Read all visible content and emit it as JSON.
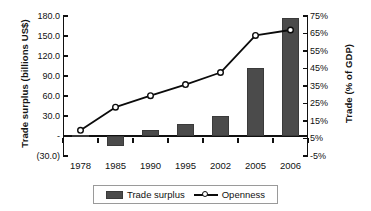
{
  "chart_data": {
    "type": "bar",
    "title": "",
    "subtitle": "",
    "categories": [
      "1978",
      "1985",
      "1990",
      "1995",
      "2002",
      "2005",
      "2006"
    ],
    "series": [
      {
        "name": "Trade surplus",
        "type": "bar",
        "axis": "left",
        "unit": "billions US$",
        "values": [
          1.0,
          -14.9,
          9.0,
          18.0,
          30.4,
          102.0,
          177.5
        ]
      },
      {
        "name": "Openness",
        "type": "line",
        "axis": "right",
        "unit": "% of GDP",
        "values": [
          9.7,
          22.9,
          29.5,
          35.8,
          42.7,
          63.9,
          67.0
        ]
      }
    ],
    "xlabel": "",
    "ylabel": "Trade surplus (billions US$)",
    "y2label": "Trade (% of GDP)",
    "ylim": [
      -30.0,
      180.0
    ],
    "y2lim": [
      -5,
      75
    ],
    "ytick_labels": [
      "180.0",
      "150.0",
      "120.0",
      "90.0",
      "60.0",
      "30.0",
      "-",
      "(30.0)"
    ],
    "ytick_values": [
      180,
      150,
      120,
      90,
      60,
      30,
      0,
      -30
    ],
    "y2tick_labels": [
      "75%",
      "65%",
      "55%",
      "45%",
      "35%",
      "25%",
      "15%",
      "5%",
      "-5%"
    ],
    "y2tick_values": [
      75,
      65,
      55,
      45,
      35,
      25,
      15,
      5,
      -5
    ],
    "grid": false,
    "legend_position": "bottom",
    "colors": {
      "bar": "#4b4b4b",
      "line": "#0b0b0b",
      "marker_fill": "#ffffff",
      "axis": "#111111",
      "legend_border": "#9a9a9a",
      "background": "#ffffff"
    }
  },
  "legend": {
    "items": [
      {
        "label": "Trade surplus",
        "marker": "bar-swatch"
      },
      {
        "label": "Openness",
        "marker": "line-circle-swatch"
      }
    ]
  }
}
